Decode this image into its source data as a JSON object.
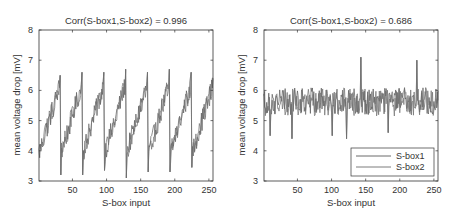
{
  "figure": {
    "width": 456,
    "height": 216,
    "line_color": "#555555",
    "axes_color": "#333333"
  },
  "chart_data": [
    {
      "type": "line",
      "title": "Corr(S-box1,S-box2) = 0.996",
      "xlabel": "S-box input",
      "ylabel": "mean voltage drop [mV]",
      "xlim": [
        1,
        256
      ],
      "ylim": [
        3,
        8
      ],
      "xticks": [
        50,
        100,
        150,
        200,
        250
      ],
      "yticks": [
        3,
        4,
        5,
        6,
        7,
        8
      ],
      "grid": false,
      "legend": null,
      "pattern": "sawtooth, period 32, rising from ~3.8 to ~6.5 then dropping sharply to ~3.2 at inputs 33, 65, 97, 129, 161, 193, 225",
      "series": [
        {
          "name": "S-box1",
          "base_min": 3.9,
          "base_max": 6.2,
          "period": 32,
          "noise": 0.35
        },
        {
          "name": "S-box2",
          "base_min": 3.9,
          "base_max": 6.2,
          "period": 32,
          "noise": 0.35
        }
      ],
      "drops": [
        {
          "x": 33,
          "y": 3.2
        },
        {
          "x": 65,
          "y": 3.2
        },
        {
          "x": 97,
          "y": 3.35
        },
        {
          "x": 129,
          "y": 3.1
        },
        {
          "x": 161,
          "y": 3.3
        },
        {
          "x": 193,
          "y": 3.3
        },
        {
          "x": 225,
          "y": 3.45
        }
      ],
      "peaks": [
        {
          "x": 32,
          "y": 6.5
        },
        {
          "x": 64,
          "y": 6.6
        },
        {
          "x": 96,
          "y": 6.6
        },
        {
          "x": 128,
          "y": 6.7
        },
        {
          "x": 160,
          "y": 6.6
        },
        {
          "x": 192,
          "y": 6.7
        },
        {
          "x": 224,
          "y": 6.6
        },
        {
          "x": 256,
          "y": 6.4
        }
      ]
    },
    {
      "type": "line",
      "title": "Corr(S-box1,S-box2) = 0.686",
      "xlabel": "S-box input",
      "ylabel": "mean voltage drop [mV]",
      "xlim": [
        1,
        256
      ],
      "ylim": [
        3,
        8
      ],
      "xticks": [
        50,
        100,
        150,
        200,
        250
      ],
      "yticks": [
        3,
        4,
        5,
        6,
        7,
        8
      ],
      "grid": false,
      "legend": {
        "position": "lower right",
        "entries": [
          "S-box1",
          "S-box2"
        ]
      },
      "pattern": "noisy signal around ~5.6 mV, range ~4.4 to ~7.1",
      "series": [
        {
          "name": "S-box1",
          "mean": 5.65,
          "noise": 0.45
        },
        {
          "name": "S-box2",
          "mean": 5.6,
          "noise": 0.45
        }
      ],
      "extremes": [
        {
          "x": 10,
          "y": 4.5
        },
        {
          "x": 42,
          "y": 4.4
        },
        {
          "x": 101,
          "y": 4.5
        },
        {
          "x": 122,
          "y": 4.4
        },
        {
          "x": 143,
          "y": 7.1
        },
        {
          "x": 225,
          "y": 7.0
        },
        {
          "x": 183,
          "y": 4.6
        }
      ]
    }
  ],
  "panels": [
    {
      "x0": 39,
      "x1": 213,
      "y0": 30,
      "y1": 181
    },
    {
      "x0": 264,
      "x1": 438,
      "y0": 30,
      "y1": 181
    }
  ]
}
